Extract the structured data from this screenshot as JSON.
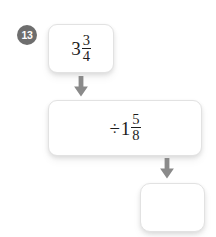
{
  "problem": {
    "number": "13",
    "type": "fraction-division-flow-diagram"
  },
  "colors": {
    "background": "#ffffff",
    "badge_fill": "#6e6e6e",
    "badge_text": "#ffffff",
    "box_fill": "#ffffff",
    "box_border": "#e2e2e2",
    "math_text": "#1d1d1d",
    "arrow_fill": "#8a8a8a"
  },
  "flow": {
    "start_box": {
      "whole": "3",
      "numerator": "3",
      "denominator": "4",
      "operator": "",
      "empty": false
    },
    "operation_box": {
      "operator": "÷",
      "whole": "1",
      "numerator": "5",
      "denominator": "8",
      "empty": false
    },
    "answer_box": {
      "value": "",
      "empty": true
    },
    "arrows": [
      {
        "name": "arrow-start-to-operation",
        "direction": "down"
      },
      {
        "name": "arrow-operation-to-answer",
        "direction": "down"
      }
    ]
  }
}
